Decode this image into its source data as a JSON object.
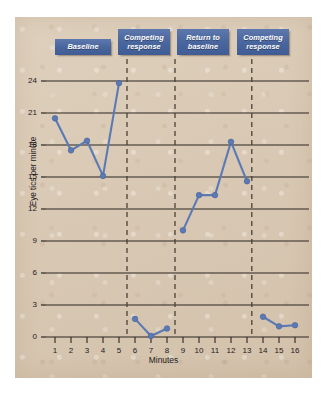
{
  "chart_data": {
    "type": "line",
    "title": "",
    "xlabel": "Minutes",
    "ylabel": "Eye tics per minute",
    "xlim": [
      0,
      16.8
    ],
    "ylim": [
      0,
      25.5
    ],
    "yticks": [
      0,
      3,
      6,
      9,
      12,
      15,
      18,
      21,
      24
    ],
    "xticks": [
      1,
      2,
      3,
      4,
      5,
      6,
      7,
      8,
      9,
      10,
      11,
      12,
      13,
      14,
      15,
      16
    ],
    "grid": "horizontal",
    "legend": "none",
    "series": [
      {
        "name": "Eye tics per minute",
        "x": [
          1,
          2,
          3,
          4,
          5,
          6,
          7,
          8,
          9,
          10,
          11,
          12,
          13,
          14,
          15,
          16
        ],
        "values": [
          20.5,
          17.5,
          18.4,
          15.1,
          23.8,
          1.7,
          0.1,
          0.8,
          10.0,
          13.3,
          13.3,
          18.3,
          14.6,
          1.9,
          1.0,
          1.1
        ],
        "color": "#5b7ab5"
      }
    ],
    "phases": [
      {
        "label": "Baseline",
        "x_start": 1,
        "x_end": 5
      },
      {
        "label": "Competing response",
        "x_start": 6,
        "x_end": 8
      },
      {
        "label": "Return to baseline",
        "x_start": 9,
        "x_end": 13
      },
      {
        "label": "Competing response",
        "x_start": 14,
        "x_end": 16
      }
    ],
    "phase_dividers": [
      5.5,
      8.5,
      13.3
    ],
    "annotations": []
  },
  "colors": {
    "series": "#5b7ab5",
    "phase_box": "#48659d",
    "panel_background": "#d9c9b4",
    "axis": "#2b2620",
    "text": "#23201c"
  },
  "axes": {
    "y_title": "Eye tics per minute",
    "x_title": "Minutes",
    "y_tick_labels": [
      "0",
      "3",
      "6",
      "9",
      "12",
      "15",
      "18",
      "21",
      "24"
    ],
    "x_tick_labels": [
      "1",
      "2",
      "3",
      "4",
      "5",
      "6",
      "7",
      "8",
      "9",
      "10",
      "11",
      "12",
      "13",
      "14",
      "15",
      "16"
    ]
  },
  "phase_labels": [
    "Baseline",
    "Competing response",
    "Return to baseline",
    "Competing response"
  ]
}
